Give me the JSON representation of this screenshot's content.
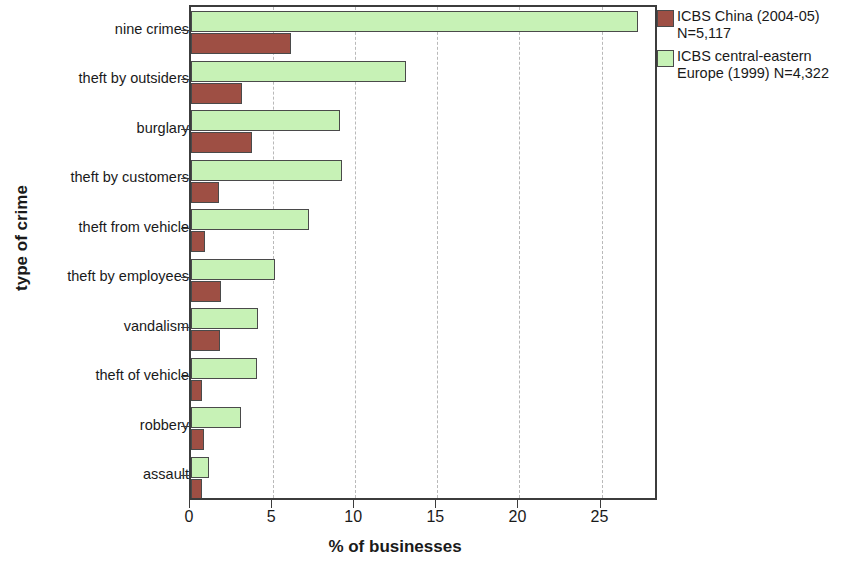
{
  "chart_data": {
    "type": "bar",
    "orientation": "horizontal",
    "title": "",
    "xlabel": "% of businesses",
    "ylabel": "type of crime",
    "xlim": [
      0,
      28.5
    ],
    "xticks": [
      0,
      5,
      10,
      15,
      20,
      25
    ],
    "xtick_labels": [
      "0",
      "5",
      "10",
      "15",
      "20",
      "25"
    ],
    "grid": "vertical-dashed",
    "legend_position": "right-top",
    "categories": [
      "nine crimes",
      "theft by outsiders",
      "burglary",
      "theft by customers",
      "theft from vehicle",
      "theft by employees",
      "vandalism",
      "theft of vehicle",
      "robbery",
      "assault"
    ],
    "series": [
      {
        "name": "ICBS central-eastern Europe (1999) N=4,322",
        "color": "#c7f2b6",
        "values": [
          27.2,
          13.1,
          9.1,
          9.2,
          7.2,
          5.1,
          4.1,
          4.0,
          3.05,
          1.1
        ]
      },
      {
        "name": "ICBS China (2004-05) N=5,117",
        "color": "#9e4f44",
        "values": [
          6.1,
          3.1,
          3.7,
          1.7,
          0.85,
          1.8,
          1.75,
          0.65,
          0.8,
          0.65
        ]
      }
    ]
  },
  "legend": {
    "entries": [
      {
        "label": "ICBS China (2004-05)\nN=5,117",
        "swatch": "brown"
      },
      {
        "label": "ICBS central-eastern\nEurope (1999) N=4,322",
        "swatch": "green"
      }
    ]
  }
}
